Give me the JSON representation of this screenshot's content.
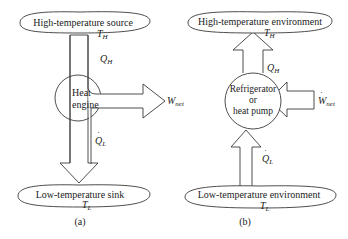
{
  "diagram_a": {
    "caption": "(a)",
    "top_reservoir": {
      "label": "High-temperature source",
      "temp": "T",
      "temp_sub": "H"
    },
    "device": {
      "line1": "Heat",
      "line2": "engine"
    },
    "heat_in": {
      "symbol": "Q",
      "sub": "H",
      "dot": "·"
    },
    "work_out": {
      "symbol": "W",
      "sub": "net"
    },
    "heat_out": {
      "symbol": "Q",
      "sub": "L",
      "dot": "·"
    },
    "bottom_reservoir": {
      "label": "Low-temperature sink",
      "temp": "T",
      "temp_sub": "L"
    }
  },
  "diagram_b": {
    "caption": "(b)",
    "top_reservoir": {
      "label": "High-temperature environment",
      "temp": "T",
      "temp_sub": "H"
    },
    "device": {
      "line1": "Refrigerator",
      "line2": "or",
      "line3": "heat pump"
    },
    "heat_out": {
      "symbol": "Q",
      "sub": "H",
      "dot": "·"
    },
    "work_in": {
      "symbol": "W",
      "sub": "net",
      "dot": "·"
    },
    "heat_in": {
      "symbol": "Q",
      "sub": "L",
      "dot": "·"
    },
    "bottom_reservoir": {
      "label": "Low-temperature environment",
      "temp": "T",
      "temp_sub": "L"
    }
  },
  "colors": {
    "stroke": "#3a3a3a",
    "text": "#222222",
    "background": "#ffffff"
  }
}
